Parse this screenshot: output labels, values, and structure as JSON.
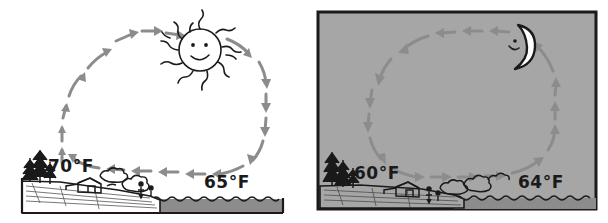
{
  "figure": {
    "type": "diagram",
    "panel_count": 2
  },
  "panels": [
    {
      "id": "day",
      "name": "daytime-sea-breeze",
      "background_color": "#ffffff",
      "has_border": false,
      "sky_body": "sun",
      "sky_body_icon": "sun-icon",
      "sky_body_expression": "smiling",
      "circulation_direction": "clockwise",
      "arrow_color": "#8c8c8c",
      "labels": [
        {
          "id": "land-temp-day",
          "text": "70°F",
          "location": "land"
        },
        {
          "id": "water-temp-day",
          "text": "65°F",
          "location": "water"
        }
      ],
      "ground_features": [
        "pine-trees",
        "barn",
        "bushes",
        "shoreline",
        "water"
      ],
      "water_color": "#8c8c8c"
    },
    {
      "id": "night",
      "name": "nighttime-land-breeze",
      "background_color": "#a6a6a6",
      "has_border": true,
      "border_color": "#1a1a1a",
      "sky_body": "moon",
      "sky_body_icon": "crescent-moon-icon",
      "sky_body_expression": "smiling",
      "circulation_direction": "counterclockwise",
      "arrow_color": "#8c8c8c",
      "labels": [
        {
          "id": "land-temp-night",
          "text": "60°F",
          "location": "land"
        },
        {
          "id": "water-temp-night",
          "text": "64°F",
          "location": "water"
        }
      ],
      "ground_features": [
        "pine-trees",
        "barn",
        "bushes",
        "shoreline",
        "water"
      ],
      "water_color": "#8c8c8c"
    }
  ],
  "colors": {
    "ink": "#1a1a1a",
    "arrow": "#8c8c8c",
    "night_sky": "#a6a6a6",
    "water": "#8c8c8c",
    "paper": "#ffffff"
  }
}
